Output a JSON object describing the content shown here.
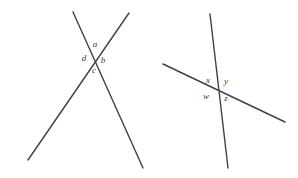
{
  "figure": {
    "background_color": "#ffffff",
    "line_color": "#404040",
    "label_color": "#3a3a3a",
    "line_width": 1.4,
    "diagrams": [
      {
        "id": "left-diagram",
        "name": "left-intersecting-lines",
        "intersection": {
          "x": 93,
          "y": 56
        },
        "lines": [
          {
            "name": "line-down-right",
            "x1": 73,
            "y1": 12,
            "x2": 143,
            "y2": 168
          },
          {
            "name": "line-down-left",
            "x1": 129,
            "y1": 13,
            "x2": 28,
            "y2": 160
          }
        ],
        "labels": [
          {
            "id": "a",
            "text": "a",
            "x": 95,
            "y": 44,
            "position": "top"
          },
          {
            "id": "b",
            "text": "b",
            "x": 103,
            "y": 60,
            "position": "right"
          },
          {
            "id": "c",
            "text": "c",
            "x": 94,
            "y": 70,
            "position": "bottom"
          },
          {
            "id": "d",
            "text": "d",
            "x": 84,
            "y": 58,
            "position": "left"
          }
        ]
      },
      {
        "id": "right-diagram",
        "name": "right-intersecting-lines",
        "intersection": {
          "x": 216,
          "y": 88
        },
        "lines": [
          {
            "name": "steep-line",
            "x1": 210,
            "y1": 14,
            "x2": 228,
            "y2": 168
          },
          {
            "name": "shallow-line",
            "x1": 163,
            "y1": 64,
            "x2": 285,
            "y2": 122
          }
        ],
        "labels": [
          {
            "id": "x",
            "text": "x",
            "x": 208,
            "y": 80,
            "position": "upper-left"
          },
          {
            "id": "y",
            "text": "y",
            "x": 226,
            "y": 81,
            "position": "upper-right"
          },
          {
            "id": "w",
            "text": "w",
            "x": 206,
            "y": 96,
            "position": "lower-left"
          },
          {
            "id": "z",
            "text": "z",
            "x": 226,
            "y": 98,
            "position": "lower-right"
          }
        ]
      }
    ]
  }
}
